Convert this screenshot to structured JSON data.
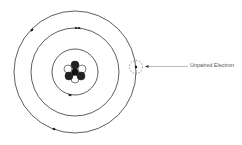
{
  "diagram": {
    "nucleus": {
      "cx": 75,
      "cy": 72,
      "r": 10
    },
    "orbits": [
      {
        "name": "inner",
        "r": 23
      },
      {
        "name": "middle",
        "r": 44
      },
      {
        "name": "outer",
        "r": 60
      }
    ],
    "electrons": [
      {
        "orbit": "outer",
        "x": 32,
        "y": 30
      },
      {
        "orbit": "outer",
        "x": 54,
        "y": 129
      },
      {
        "orbit": "middle",
        "x": 76,
        "y": 32
      },
      {
        "orbit": "middle",
        "x": 79,
        "y": 32
      },
      {
        "orbit": "inner",
        "x": 70,
        "y": 95
      }
    ],
    "unpaired": {
      "x": 136,
      "y": 67,
      "ring_r": 7
    },
    "annotation": {
      "label": "Unpaired Electron",
      "arrow_from_x": 188,
      "arrow_to_x": 146,
      "y": 66
    }
  }
}
